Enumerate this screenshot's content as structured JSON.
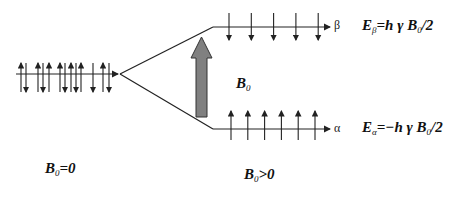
{
  "labels": {
    "b0_field": {
      "main": "B",
      "sub": "0"
    },
    "left_caption": {
      "main": "B",
      "sub": "0",
      "rest": "=0"
    },
    "right_caption": {
      "main": "B",
      "sub": "0",
      "rest": ">0"
    },
    "beta_level": "β",
    "alpha_level": "α",
    "energy_beta": {
      "main": "E",
      "sub": "β",
      "rest": "=h γ B",
      "sub2": "0",
      "tail": "/2"
    },
    "energy_alpha": {
      "main": "E",
      "sub": "α",
      "rest": "=−h γ B",
      "sub2": "0",
      "tail": "/2"
    }
  },
  "colors": {
    "line": "#222222",
    "field_arrow": "#808080"
  },
  "left_spins": [
    "up",
    "down",
    "up",
    "down",
    "up",
    "up",
    "down",
    "up",
    "down",
    "up",
    "down",
    "up",
    "down"
  ],
  "beta_spins": 5,
  "alpha_spins": 6
}
